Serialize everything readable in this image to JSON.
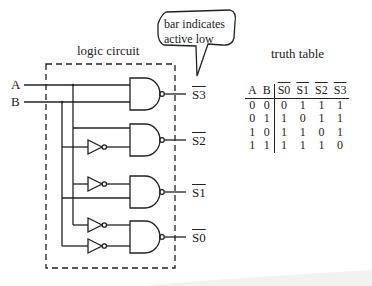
{
  "title_circuit": "logic circuit",
  "title_table": "truth table",
  "callout": {
    "line1": "bar indicates",
    "line2": "active low"
  },
  "inputs": {
    "a": "A",
    "b": "B"
  },
  "outputs": {
    "s3": "S3",
    "s2": "S2",
    "s1": "S1",
    "s0": "S0"
  },
  "truth_table": {
    "headers": [
      "A",
      "B",
      "S0",
      "S1",
      "S2",
      "S3"
    ],
    "overlined_headers": [
      "S0",
      "S1",
      "S2",
      "S3"
    ],
    "rows": [
      [
        "0",
        "0",
        "0",
        "1",
        "1",
        "1"
      ],
      [
        "0",
        "1",
        "1",
        "0",
        "1",
        "1"
      ],
      [
        "1",
        "0",
        "1",
        "1",
        "0",
        "1"
      ],
      [
        "1",
        "1",
        "1",
        "1",
        "1",
        "0"
      ]
    ]
  },
  "colors": {
    "ink": "#222222",
    "background": "#ffffff"
  }
}
